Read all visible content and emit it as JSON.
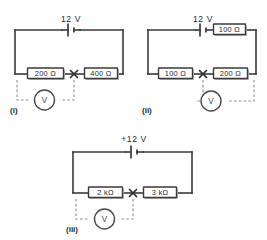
{
  "figure": {
    "background_color": "#ffffff",
    "wire_color": "#3a3a3a",
    "probe_color": "#8d8d8d",
    "text_color": "#2b2b2b"
  },
  "circuits": [
    {
      "id": "i",
      "caption": "(i)",
      "source_label": "12 V",
      "source_type": "battery",
      "meter_label": "V",
      "meter_name": "voltmeter",
      "node_marker": "x",
      "resistors": [
        {
          "label": "200 Ω",
          "position": "bottom-left",
          "value": 200,
          "unit": "Ω"
        },
        {
          "label": "400 Ω",
          "position": "bottom-right",
          "value": 400,
          "unit": "Ω"
        }
      ]
    },
    {
      "id": "ii",
      "caption": "(ii)",
      "source_label": "12 V",
      "source_type": "battery",
      "meter_label": "V",
      "meter_name": "voltmeter",
      "node_marker": "x",
      "resistors": [
        {
          "label": "100 Ω",
          "position": "top-right",
          "value": 100,
          "unit": "Ω"
        },
        {
          "label": "100 Ω",
          "position": "bottom-left",
          "value": 100,
          "unit": "Ω"
        },
        {
          "label": "200 Ω",
          "position": "bottom-right",
          "value": 200,
          "unit": "Ω"
        }
      ]
    },
    {
      "id": "iii",
      "caption": "(iii)",
      "source_label": "+12 V",
      "source_type": "battery",
      "meter_label": "V",
      "meter_name": "voltmeter",
      "node_marker": "x",
      "resistors": [
        {
          "label": "2 kΩ",
          "position": "bottom-left",
          "value": 2,
          "unit": "kΩ"
        },
        {
          "label": "3 kΩ",
          "position": "bottom-right",
          "value": 3,
          "unit": "kΩ"
        }
      ]
    }
  ]
}
